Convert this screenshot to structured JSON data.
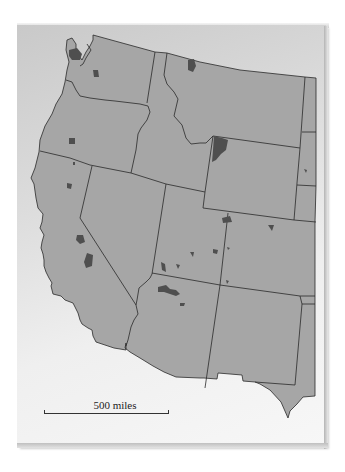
{
  "figure": {
    "type": "map",
    "region": "Western United States",
    "colors": {
      "land": "#a6a6a6",
      "borders": "#2a2a2a",
      "highlighted_areas": "#4f4f4f",
      "background": "#e6e6e6"
    }
  },
  "scale_bar": {
    "label": "500 miles"
  },
  "highlighted_area_count": 22
}
